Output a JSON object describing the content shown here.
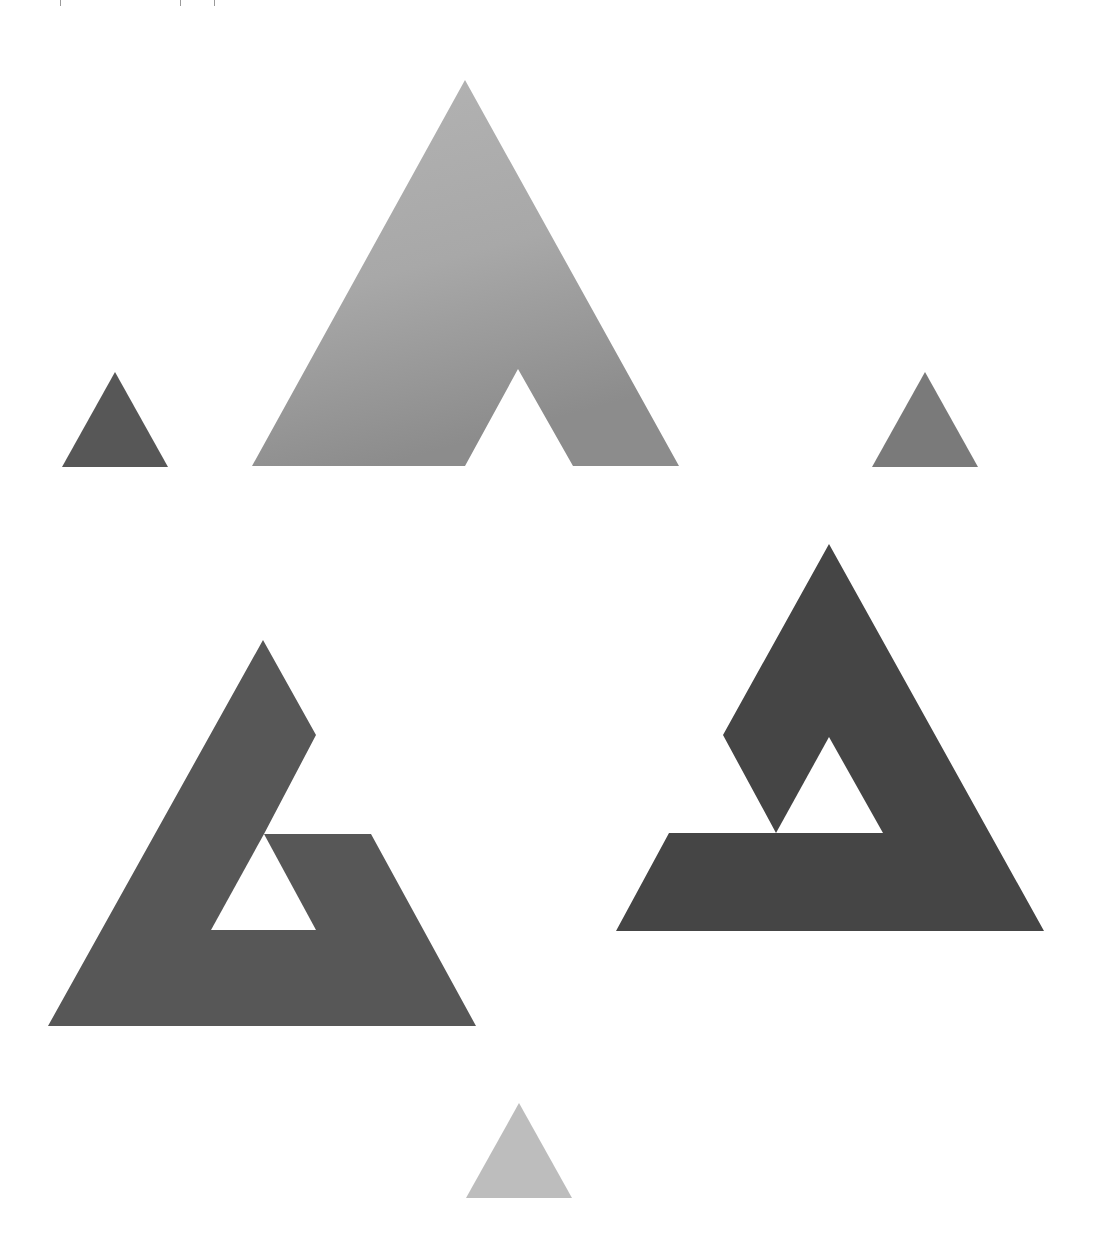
{
  "figure": {
    "background": "#ffffff"
  },
  "shapes": {
    "top_large": {
      "label": "top-notched-triangle",
      "color_top": "#b4b4b4",
      "color_bottom": "#8c8c8c",
      "points": "465,80 679,466 573,466 518,369 411,369 465,273 518,369 465,466 252,466"
    },
    "bottom_left_large": {
      "label": "bottom-left-notched-triangle",
      "color": "#575757",
      "points": "263,640 316,735 264,834 371,834 476,1026 48,1026"
    },
    "bottom_left_hole": {
      "label": "bottom-left-inner-triangle-hole",
      "points": "264,834 316,930 211,930"
    },
    "bottom_right_large": {
      "label": "bottom-right-notched-triangle",
      "color": "#454545",
      "points": "829,544 1044,931 616,931 669,833 776,833 723,735"
    },
    "bottom_right_hole": {
      "label": "bottom-right-inner-triangle-hole",
      "points": "829,737 883,833 776,833"
    },
    "small_left": {
      "label": "small-left-triangle",
      "color": "#575757",
      "points": "115,372 168,467 62,467"
    },
    "small_right": {
      "label": "small-right-triangle",
      "color": "#7a7a7a",
      "points": "925,372 978,467 872,467"
    },
    "small_bottom": {
      "label": "small-bottom-triangle",
      "color": "#bdbdbd",
      "points": "519,1103 572,1198 466,1198"
    }
  }
}
